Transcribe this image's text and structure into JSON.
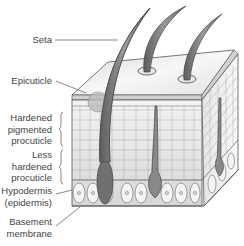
{
  "diagram": {
    "labels": {
      "seta": "Seta",
      "epicuticle": "Epicuticle",
      "hardened_1": "Hardened",
      "hardened_2": "pigmented",
      "hardened_3": "procuticle",
      "less_1": "Less",
      "less_2": "hardened",
      "less_3": "procuticle",
      "hypodermis_1": "Hypodermis",
      "hypodermis_2": "(epidermis)",
      "basement_1": "Basement",
      "basement_2": "membrane"
    },
    "colors": {
      "outline": "#555555",
      "seta": "#7a7a7a",
      "face_light": "#f2f2f2",
      "face_mid": "#dcdcdc",
      "label_text": "#444444"
    }
  }
}
